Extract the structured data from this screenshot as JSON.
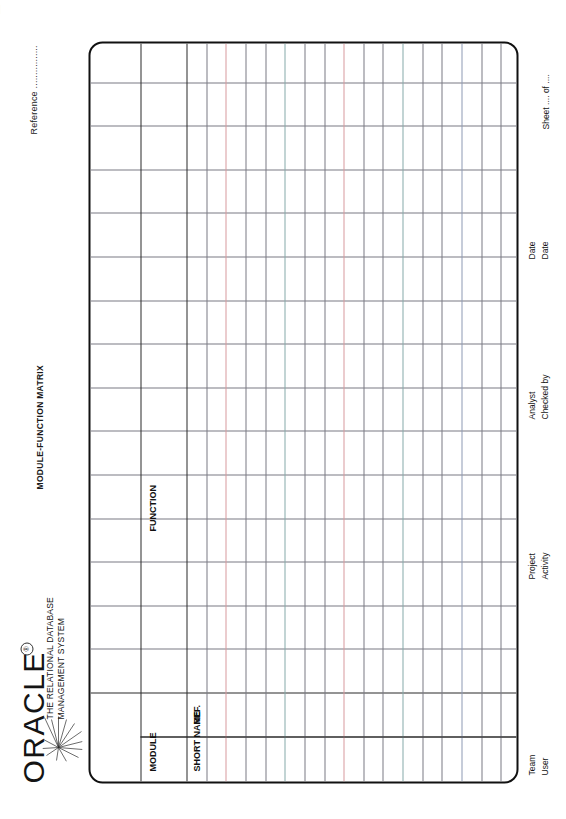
{
  "document": {
    "title": "MODULE-FUNCTION MATRIX",
    "reference_label": "Reference ................",
    "sheet_label": "Sheet .... of ...."
  },
  "logo": {
    "wordmark": "ORACLE",
    "registered_mark": "®",
    "tagline_line1": "THE RELATIONAL DATABASE",
    "tagline_line2": "MANAGEMENT SYSTEM",
    "starburst_icon": "oracle-starburst-icon"
  },
  "table": {
    "headers": {
      "module": "MODULE",
      "short_name": "SHORT NAME",
      "ref": "REF.",
      "function": "FUNCTION"
    },
    "grid": {
      "body_columns": 15,
      "body_rows": 17,
      "left_block_columns": 2,
      "header_band_rows": 2,
      "rows": [],
      "cells": []
    }
  },
  "footer": {
    "team_label": "Team",
    "user_label": "User",
    "project_label": "Project",
    "activity_label": "Activity",
    "analyst_label": "Analyst",
    "checked_by_label": "Checked by",
    "date_label_1": "Date",
    "date_label_2": "Date"
  },
  "colors": {
    "ink": "#111111",
    "rule": "#7b7b84",
    "rule_strong": "#2b2b2b",
    "tint_red": "#d79a9e",
    "tint_teal": "#86a9a9",
    "paper": "#ffffff"
  }
}
